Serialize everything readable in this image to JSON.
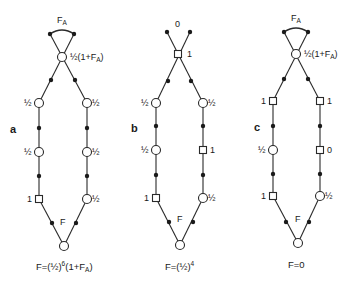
{
  "figure": {
    "colors": {
      "ink": "#1a1a1a",
      "background": "#ffffff"
    }
  },
  "panels": [
    {
      "id": "a",
      "letter": "a",
      "top_label": "F",
      "top_label_sub": "A",
      "apex": {
        "shape": "circle",
        "label": "½(1+F",
        "label_sub": "A",
        "label_close": ")"
      },
      "left_column": [
        {
          "shape": "circle",
          "label": "½"
        },
        {
          "shape": "circle",
          "label": "½"
        },
        {
          "shape": "square",
          "label": "1"
        }
      ],
      "right_column": [
        {
          "shape": "circle",
          "label": "½"
        },
        {
          "shape": "circle",
          "label": "½"
        },
        {
          "shape": "circle",
          "label": "½"
        }
      ],
      "bottom": {
        "shape": "circle",
        "label": "F"
      },
      "formula": {
        "prefix": "F=(½)",
        "exp": "6",
        "suffix": "(1+F",
        "suffix_sub": "A",
        "suffix_close": ")"
      }
    },
    {
      "id": "b",
      "letter": "b",
      "top_label": "0",
      "top_label_sub": "",
      "apex": {
        "shape": "square",
        "label": "1",
        "label_sub": "",
        "label_close": ""
      },
      "left_column": [
        {
          "shape": "circle",
          "label": "½"
        },
        {
          "shape": "circle",
          "label": "½"
        },
        {
          "shape": "square",
          "label": "1"
        }
      ],
      "right_column": [
        {
          "shape": "circle",
          "label": "½"
        },
        {
          "shape": "square",
          "label": "1"
        },
        {
          "shape": "circle",
          "label": "½"
        }
      ],
      "bottom": {
        "shape": "circle",
        "label": "F"
      },
      "formula": {
        "prefix": "F=(½)",
        "exp": "4",
        "suffix": "",
        "suffix_sub": "",
        "suffix_close": ""
      }
    },
    {
      "id": "c",
      "letter": "c",
      "top_label": "F",
      "top_label_sub": "A",
      "apex": {
        "shape": "circle",
        "label": "½(1+F",
        "label_sub": "A",
        "label_close": ")"
      },
      "left_column": [
        {
          "shape": "square",
          "label": "1"
        },
        {
          "shape": "circle",
          "label": "½"
        },
        {
          "shape": "square",
          "label": "1"
        }
      ],
      "right_column": [
        {
          "shape": "square",
          "label": "1"
        },
        {
          "shape": "square",
          "label": "0"
        },
        {
          "shape": "circle",
          "label": "½"
        }
      ],
      "bottom": {
        "shape": "circle",
        "label": "F"
      },
      "formula": {
        "prefix": "F=0",
        "exp": "",
        "suffix": "",
        "suffix_sub": "",
        "suffix_close": ""
      }
    }
  ]
}
